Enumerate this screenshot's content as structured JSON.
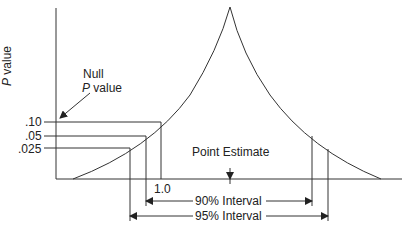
{
  "diagram": {
    "y_axis_label_italic": "P",
    "y_axis_label_rest": " value",
    "null_label_line1": "Null",
    "null_label_italic": "P",
    "null_label_rest": " value",
    "p_ticks": [
      ".10",
      ".05",
      ".025"
    ],
    "null_value_label": "1.0",
    "point_estimate_label": "Point Estimate",
    "interval_90_label": "90% Interval",
    "interval_95_label": "95% Interval",
    "colors": {
      "line": "#333333",
      "text": "#222222",
      "background": "#ffffff"
    }
  }
}
